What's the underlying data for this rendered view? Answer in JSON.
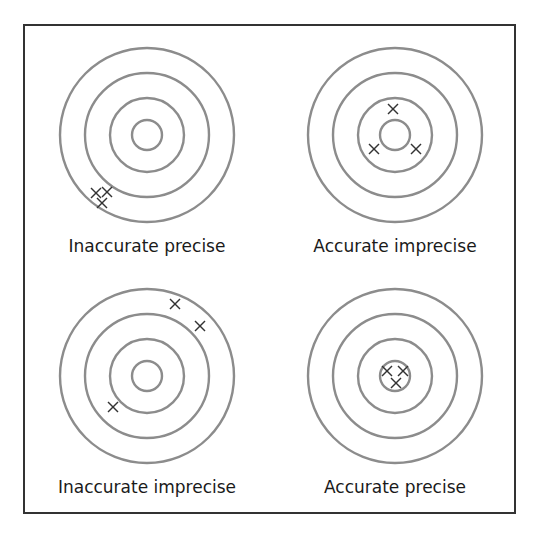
{
  "diagram": {
    "type": "accuracy-precision-targets",
    "ring_color": "#8c8c8c",
    "mark_color": "#333333",
    "frame_color": "#333333",
    "rings_radii": [
      87,
      62,
      37,
      15
    ],
    "targets": [
      {
        "label": "Inaccurate precise",
        "center": [
          147,
          135
        ],
        "marks": [
          [
            -51,
            58
          ],
          [
            -40,
            57
          ],
          [
            -45,
            68
          ]
        ]
      },
      {
        "label": "Accurate imprecise",
        "center": [
          395,
          135
        ],
        "marks": [
          [
            -2,
            -26
          ],
          [
            -21,
            14
          ],
          [
            21,
            14
          ]
        ]
      },
      {
        "label": "Inaccurate imprecise",
        "center": [
          147,
          376
        ],
        "marks": [
          [
            28,
            -72
          ],
          [
            53,
            -50
          ],
          [
            -34,
            31
          ]
        ]
      },
      {
        "label": "Accurate precise",
        "center": [
          395,
          376
        ],
        "marks": [
          [
            -8,
            -5
          ],
          [
            8,
            -5
          ],
          [
            1,
            7
          ]
        ]
      }
    ]
  }
}
